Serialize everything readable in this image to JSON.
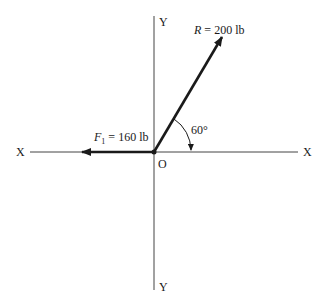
{
  "axes": {
    "x_left_label": "X",
    "x_right_label": "X",
    "y_top_label": "Y",
    "y_bottom_label": "Y",
    "origin_label": "O"
  },
  "vectors": {
    "R": {
      "symbol": "R",
      "equals": "=",
      "value": "200 lb",
      "angle_deg": 60
    },
    "F1": {
      "symbol": "F",
      "subscript": "1",
      "equals": "=",
      "value": "160 lb"
    }
  },
  "angle": {
    "label": "60°"
  },
  "colors": {
    "line": "#1a1a1a",
    "axis": "#444444"
  }
}
